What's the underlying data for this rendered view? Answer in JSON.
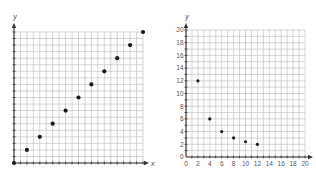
{
  "chart_data": [
    {
      "type": "scatter",
      "title": "",
      "xlabel": "x",
      "ylabel": "y",
      "xlim": [
        0,
        20
      ],
      "ylim": [
        0,
        20
      ],
      "grid": true,
      "tick_labels_shown": false,
      "x": [
        0,
        2,
        4,
        6,
        8,
        10,
        12,
        14,
        16,
        18,
        20
      ],
      "y": [
        0,
        2,
        4,
        6,
        8,
        10,
        12,
        14,
        16,
        18,
        20
      ],
      "legend": null
    },
    {
      "type": "scatter",
      "title": "",
      "xlabel": "",
      "ylabel": "y",
      "xlim": [
        0,
        20
      ],
      "ylim": [
        0,
        20
      ],
      "grid": true,
      "tick_labels_shown": true,
      "x_ticks": [
        0,
        2,
        4,
        6,
        8,
        10,
        12,
        14,
        16,
        18,
        20
      ],
      "y_ticks": [
        0,
        2,
        4,
        6,
        8,
        10,
        12,
        14,
        16,
        18,
        20
      ],
      "x": [
        2,
        4,
        6,
        8,
        10,
        12
      ],
      "y": [
        12,
        6,
        4,
        3,
        2.4,
        2
      ],
      "legend": null
    }
  ],
  "left": {
    "x_axis_label": "x",
    "y_axis_label": "y"
  },
  "right": {
    "y_axis_label": "y"
  }
}
